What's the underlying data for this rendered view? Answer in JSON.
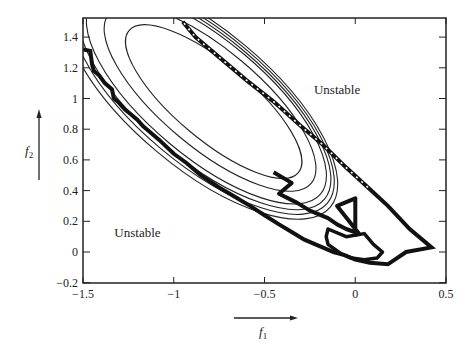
{
  "chart_data": {
    "type": "line",
    "title": "",
    "xlabel": "f1",
    "ylabel": "f2",
    "xlim": [
      -1.5,
      0.5
    ],
    "ylim": [
      -0.2,
      1.5
    ],
    "grid": false,
    "legend": "none",
    "x_ticks": [
      {
        "value": -1.5,
        "label": "−1.5"
      },
      {
        "value": -1.0,
        "label": "−1"
      },
      {
        "value": -0.5,
        "label": "−0.5"
      },
      {
        "value": 0.0,
        "label": "0"
      },
      {
        "value": 0.5,
        "label": "0.5"
      }
    ],
    "y_ticks": [
      {
        "value": -0.2,
        "label": "−0.2"
      },
      {
        "value": 0.0,
        "label": "0"
      },
      {
        "value": 0.2,
        "label": "0.2"
      },
      {
        "value": 0.4,
        "label": "0.4"
      },
      {
        "value": 0.6,
        "label": "0.6"
      },
      {
        "value": 0.8,
        "label": "0.8"
      },
      {
        "value": 1.0,
        "label": "1"
      },
      {
        "value": 1.2,
        "label": "1.2"
      },
      {
        "value": 1.4,
        "label": "1.4"
      }
    ],
    "annotations": [
      {
        "text": "Unstable",
        "x": -0.1,
        "y": 1.03
      },
      {
        "text": "Unstable",
        "x": -1.2,
        "y": 0.1
      }
    ],
    "axis_label_xy": {
      "f1_sub": "1",
      "f2_sub": "2"
    },
    "stability_boundary": {
      "name": "stability-boundary",
      "points": [
        [
          -1.5,
          1.32
        ],
        [
          -1.46,
          1.31
        ],
        [
          -1.45,
          1.22
        ],
        [
          -1.44,
          1.18
        ],
        [
          -1.41,
          1.15
        ],
        [
          -1.38,
          1.1
        ],
        [
          -1.34,
          1.06
        ],
        [
          -1.33,
          1.0
        ],
        [
          -1.3,
          0.97
        ],
        [
          -1.27,
          0.93
        ],
        [
          -1.24,
          0.9
        ],
        [
          -1.2,
          0.86
        ],
        [
          -1.17,
          0.82
        ],
        [
          -1.13,
          0.78
        ],
        [
          -1.08,
          0.73
        ],
        [
          -1.0,
          0.64
        ],
        [
          -0.93,
          0.58
        ],
        [
          -0.85,
          0.5
        ],
        [
          -0.75,
          0.42
        ],
        [
          -0.65,
          0.35
        ],
        [
          -0.58,
          0.3
        ],
        [
          -0.5,
          0.24
        ],
        [
          -0.42,
          0.18
        ],
        [
          -0.35,
          0.13
        ],
        [
          -0.28,
          0.08
        ],
        [
          -0.2,
          0.04
        ],
        [
          -0.12,
          0.0
        ],
        [
          -0.06,
          -0.02
        ],
        [
          0.0,
          -0.05
        ],
        [
          0.08,
          -0.07
        ],
        [
          0.18,
          -0.08
        ],
        [
          0.28,
          0.0
        ],
        [
          0.42,
          0.03
        ],
        [
          0.3,
          0.15
        ],
        [
          0.18,
          0.3
        ],
        [
          0.07,
          0.42
        ],
        [
          -0.05,
          0.55
        ],
        [
          -0.18,
          0.7
        ],
        [
          -0.3,
          0.82
        ],
        [
          -0.45,
          0.98
        ],
        [
          -0.6,
          1.12
        ],
        [
          -0.75,
          1.27
        ],
        [
          -0.88,
          1.4
        ],
        [
          -0.95,
          1.5
        ]
      ]
    },
    "contours": [
      {
        "name": "contour-1",
        "cx": -0.78,
        "cy": 0.98,
        "rx": 0.21,
        "ry": 0.72,
        "angle": -50
      },
      {
        "name": "contour-2",
        "cx": -0.8,
        "cy": 1.0,
        "rx": 0.27,
        "ry": 0.86,
        "angle": -50
      },
      {
        "name": "contour-3",
        "cx": -0.82,
        "cy": 1.0,
        "rx": 0.32,
        "ry": 0.97,
        "angle": -50
      },
      {
        "name": "contour-4",
        "cx": -0.83,
        "cy": 1.0,
        "rx": 0.34,
        "ry": 1.02,
        "angle": -50
      },
      {
        "name": "contour-5",
        "cx": -0.84,
        "cy": 1.0,
        "rx": 0.36,
        "ry": 1.06,
        "angle": -50
      },
      {
        "name": "contour-6",
        "cx": -0.85,
        "cy": 1.0,
        "rx": 0.38,
        "ry": 1.1,
        "angle": -50
      }
    ],
    "trajectory": {
      "name": "adaptation-trajectory",
      "points": [
        [
          -0.45,
          0.52
        ],
        [
          -0.35,
          0.45
        ],
        [
          -0.42,
          0.38
        ],
        [
          -0.32,
          0.32
        ],
        [
          -0.25,
          0.27
        ],
        [
          -0.15,
          0.22
        ],
        [
          -0.1,
          0.18
        ],
        [
          -0.05,
          0.15
        ],
        [
          0.02,
          0.12
        ],
        [
          -0.1,
          0.3
        ],
        [
          0.0,
          0.35
        ],
        [
          0.0,
          0.1
        ]
      ]
    },
    "loop": {
      "name": "limit-loop",
      "points": [
        [
          -0.15,
          0.15
        ],
        [
          -0.05,
          0.1
        ],
        [
          0.05,
          0.12
        ],
        [
          0.1,
          0.05
        ],
        [
          0.15,
          0.0
        ],
        [
          0.12,
          -0.04
        ],
        [
          0.05,
          -0.05
        ],
        [
          -0.02,
          -0.04
        ],
        [
          -0.08,
          -0.01
        ],
        [
          -0.15,
          0.05
        ],
        [
          -0.16,
          0.1
        ],
        [
          -0.15,
          0.15
        ]
      ]
    }
  }
}
